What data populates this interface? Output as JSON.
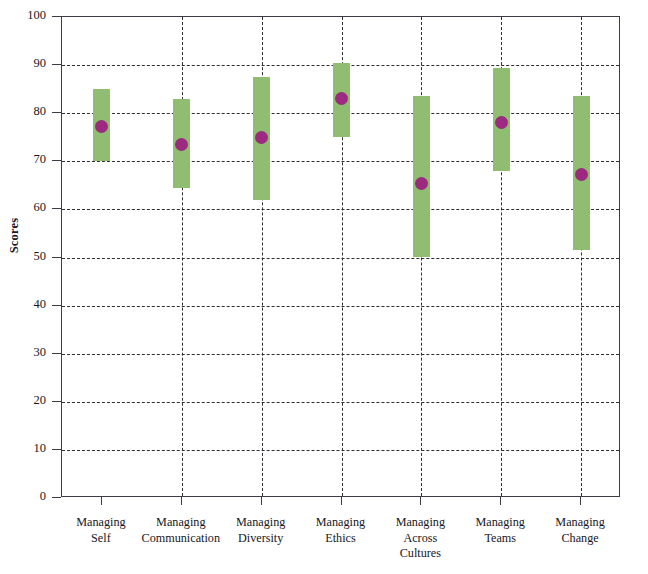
{
  "chart_data": {
    "type": "bar",
    "title": "",
    "xlabel": "",
    "ylabel": "Scores",
    "ylim": [
      0,
      100
    ],
    "yticks": [
      0,
      10,
      20,
      30,
      40,
      50,
      60,
      70,
      80,
      90,
      100
    ],
    "grid": "dashed horizontal and vertical",
    "legend": "none",
    "categories": [
      "Managing Self",
      "Managing Communication",
      "Managing Diversity",
      "Managing Ethics",
      "Managing Across Cultures",
      "Managing Teams",
      "Managing Change"
    ],
    "category_lines": [
      [
        "Managing",
        "Self"
      ],
      [
        "Managing",
        "Communication"
      ],
      [
        "Managing",
        "Diversity"
      ],
      [
        "Managing",
        "Ethics"
      ],
      [
        "Managing",
        "Across",
        "Cultures"
      ],
      [
        "Managing",
        "Teams"
      ],
      [
        "Managing",
        "Change"
      ]
    ],
    "series": [
      {
        "name": "Score range",
        "type": "range-bar",
        "color": "#8fbe72",
        "low": [
          70.0,
          64.5,
          62.0,
          75.0,
          50.0,
          68.0,
          51.5
        ],
        "high": [
          85.0,
          83.0,
          87.5,
          90.5,
          83.5,
          89.5,
          83.5
        ]
      },
      {
        "name": "Mean score",
        "type": "point",
        "color": "#9c2a80",
        "values": [
          77.3,
          73.5,
          75.0,
          83.0,
          65.3,
          78.0,
          67.3
        ]
      }
    ]
  },
  "colors": {
    "range_bar": "#8fbe72",
    "point": "#9c2a80",
    "axis": "#3c3c44",
    "grid": "#2e2e34",
    "background": "#ffffff"
  }
}
